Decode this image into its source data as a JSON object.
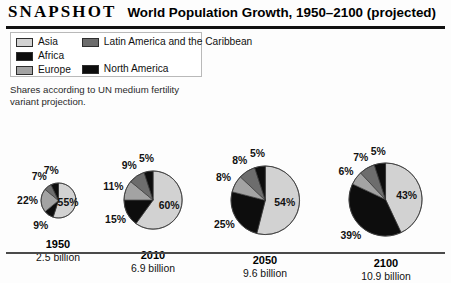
{
  "header": {
    "kicker": "SNAPSHOT",
    "title": "World Population Growth, 1950–2100 (projected)"
  },
  "note": "Shares according to UN medium fertility variant projection.",
  "legend": {
    "left": [
      {
        "label": "Asia",
        "color": "#d2d2d2"
      },
      {
        "label": "Africa",
        "color": "#0d0d0d"
      },
      {
        "label": "Europe",
        "color": "#a3a3a3"
      }
    ],
    "right": [
      {
        "label": "Latin America and the Caribbean",
        "color": "#6d6d6d"
      },
      {
        "label": "North America",
        "color": "#0d0d0d"
      }
    ]
  },
  "colors": {
    "asia": "#d2d2d2",
    "africa": "#0d0d0d",
    "europe": "#a3a3a3",
    "latin_america": "#6d6d6d",
    "north_america": "#0d0d0d",
    "stroke": "#3a3a3a",
    "rule": "#111111"
  },
  "chart_data": {
    "type": "pie",
    "title": "World Population Growth, 1950–2100 (projected)",
    "subtitle": "Shares according to UN medium fertility variant projection.",
    "note": "Pie area scales with total population; slices ordered clockwise from 12 o'clock.",
    "categories": [
      "Asia",
      "Africa",
      "Europe",
      "Latin America and the Caribbean",
      "North America"
    ],
    "legend_position": "top-left",
    "unit": "percent of world population",
    "charts": [
      {
        "year": "1950",
        "population_label": "2.5 billion",
        "population_billions": 2.5,
        "values": [
          55,
          9,
          22,
          7,
          7
        ],
        "labels": [
          "55%",
          "9%",
          "22%",
          "7%",
          "7%"
        ]
      },
      {
        "year": "2010",
        "population_label": "6.9 billion",
        "population_billions": 6.9,
        "values": [
          60,
          15,
          11,
          9,
          5
        ],
        "labels": [
          "60%",
          "15%",
          "11%",
          "9%",
          "5%"
        ]
      },
      {
        "year": "2050",
        "population_label": "9.6 billion",
        "population_billions": 9.6,
        "values": [
          54,
          25,
          8,
          8,
          5
        ],
        "labels": [
          "54%",
          "25%",
          "8%",
          "8%",
          "5%"
        ]
      },
      {
        "year": "2100",
        "population_label": "10.9 billion",
        "population_billions": 10.9,
        "values": [
          43,
          39,
          6,
          7,
          5
        ],
        "labels": [
          "43%",
          "39%",
          "6%",
          "7%",
          "5%"
        ]
      }
    ]
  }
}
